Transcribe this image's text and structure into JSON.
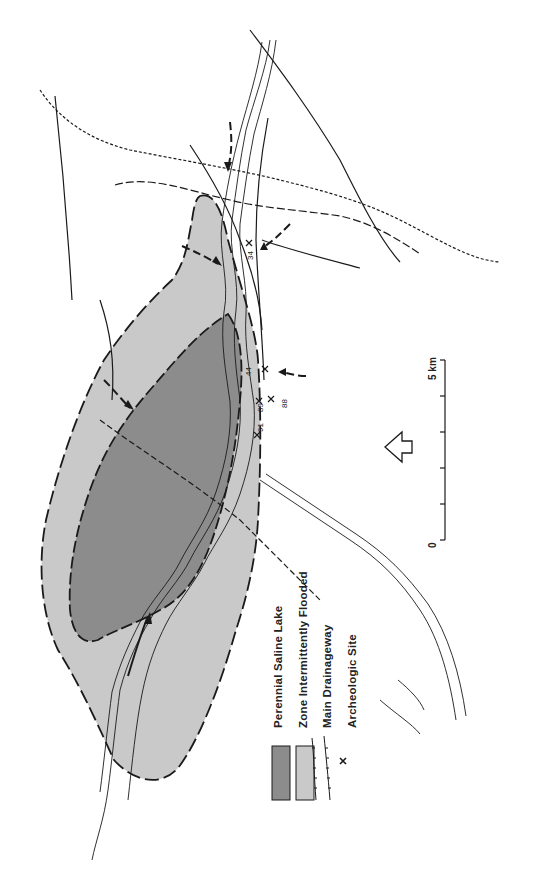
{
  "map": {
    "colors": {
      "perennial_lake": "#8c8c8c",
      "intermittent_zone": "#c9c9c9",
      "line": "#1a1a1a",
      "background": "#ffffff"
    },
    "orientation": "rotated 90° counter-clockwise; north arrow points left",
    "north_arrow": "outline-arrow-icon"
  },
  "legend": {
    "items": [
      {
        "symbol": "dark-gray-swatch",
        "label": "Perennial Saline Lake"
      },
      {
        "symbol": "light-gray-swatch",
        "label": "Zone Intermittently Flooded"
      },
      {
        "symbol": "hachured-line-icon",
        "label": "Main Drainageway"
      },
      {
        "symbol": "X",
        "label": "Archeologic Site"
      }
    ]
  },
  "scale_bar": {
    "start_label": "0",
    "end_label": "5 km",
    "divisions": 5
  },
  "sites": [
    {
      "label": "34"
    },
    {
      "label": "44"
    },
    {
      "label": "88"
    },
    {
      "label": "89"
    },
    {
      "label": "91"
    }
  ]
}
